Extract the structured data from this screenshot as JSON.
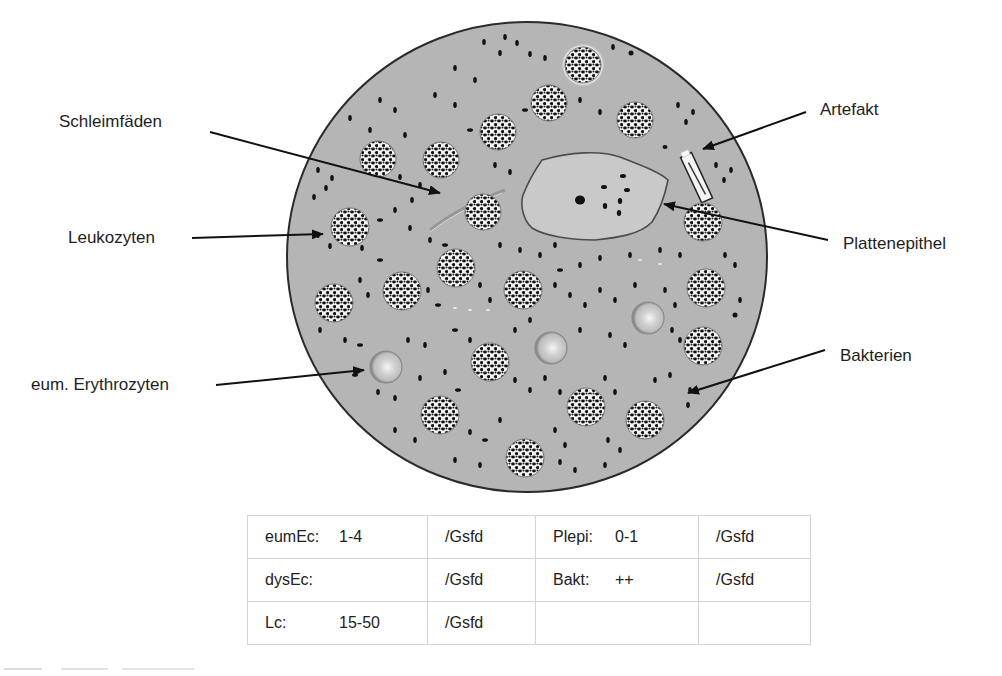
{
  "figure": {
    "labels": {
      "schleimfaeden": "Schleimfäden",
      "leukozyten": "Leukozyten",
      "erythrozyten": "eum. Erythrozyten",
      "artefakt": "Artefakt",
      "plattenepithel": "Plattenepithel",
      "bakterien": "Bakterien"
    },
    "colors": {
      "field_background": "#b5b5b5",
      "field_border": "#2a2a2a",
      "epithel_fill": "#c6c6c6",
      "cell_dots": "#111111",
      "arrow": "#111111"
    }
  },
  "results_table": {
    "unit": "/Gsfd",
    "rows": [
      {
        "left_key": "eumEc:",
        "left_value": "1-4",
        "left_unit": "/Gsfd",
        "right_key": "Plepi:",
        "right_value": "0-1",
        "right_unit": "/Gsfd"
      },
      {
        "left_key": "dysEc:",
        "left_value": "",
        "left_unit": "/Gsfd",
        "right_key": "Bakt:",
        "right_value": "++",
        "right_unit": "/Gsfd"
      },
      {
        "left_key": "Lc:",
        "left_value": "15-50",
        "left_unit": "/Gsfd",
        "right_key": "",
        "right_value": "",
        "right_unit": ""
      }
    ]
  }
}
